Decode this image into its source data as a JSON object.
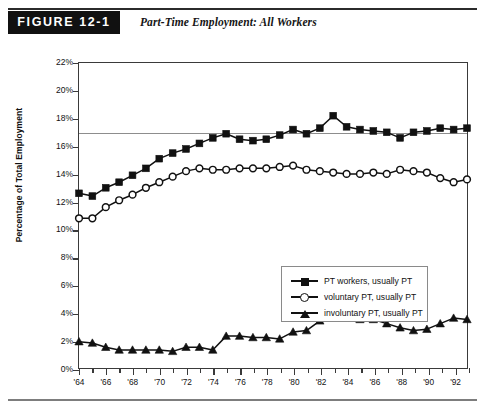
{
  "header": {
    "badge_label": "FIGURE 12-1",
    "title": "Part-Time Employment: All Workers"
  },
  "chart_data": {
    "type": "line",
    "title": "Part-Time Employment: All Workers",
    "xlabel": "",
    "ylabel": "Percentage of Total Employment",
    "ylim": [
      0,
      22
    ],
    "xlim": [
      1964,
      1993
    ],
    "ytick_labels": [
      "0%",
      "2%",
      "4%",
      "6%",
      "8%",
      "10%",
      "12%",
      "14%",
      "16%",
      "18%",
      "20%",
      "22%"
    ],
    "ytick_values": [
      0,
      2,
      4,
      6,
      8,
      10,
      12,
      14,
      16,
      18,
      20,
      22
    ],
    "xtick_labels": [
      "'64",
      "'66",
      "'68",
      "'70",
      "'72",
      "'74",
      "'76",
      "'78",
      "'80",
      "'82",
      "'84",
      "'86",
      "'88",
      "'90",
      "'92"
    ],
    "xtick_values": [
      1964,
      1966,
      1968,
      1970,
      1972,
      1974,
      1976,
      1978,
      1980,
      1982,
      1984,
      1986,
      1988,
      1990,
      1992
    ],
    "grid": false,
    "reference_line": 17.0,
    "legend_position": "center-right",
    "x": [
      1964,
      1965,
      1966,
      1967,
      1968,
      1969,
      1970,
      1971,
      1972,
      1973,
      1974,
      1975,
      1976,
      1977,
      1978,
      1979,
      1980,
      1981,
      1982,
      1983,
      1984,
      1985,
      1986,
      1987,
      1988,
      1989,
      1990,
      1991,
      1992,
      1993
    ],
    "series": [
      {
        "name": "PT workers, usually PT",
        "marker": "square-filled",
        "color": "#111111",
        "values": [
          12.6,
          12.4,
          13.0,
          13.4,
          13.9,
          14.4,
          15.1,
          15.5,
          15.8,
          16.2,
          16.6,
          16.9,
          16.5,
          16.4,
          16.5,
          16.8,
          17.2,
          16.9,
          17.3,
          18.2,
          17.4,
          17.2,
          17.1,
          17.0,
          16.6,
          17.0,
          17.1,
          17.3,
          17.2,
          17.3
        ]
      },
      {
        "name": "voluntary PT, usually PT",
        "marker": "circle-open",
        "color": "#111111",
        "values": [
          10.8,
          10.8,
          11.6,
          12.1,
          12.5,
          13.0,
          13.4,
          13.8,
          14.2,
          14.4,
          14.3,
          14.3,
          14.4,
          14.4,
          14.4,
          14.5,
          14.6,
          14.3,
          14.2,
          14.1,
          14.0,
          14.0,
          14.1,
          14.0,
          14.3,
          14.2,
          14.1,
          13.7,
          13.4,
          13.6
        ]
      },
      {
        "name": "involuntary PT, usually PT",
        "marker": "triangle-filled",
        "color": "#111111",
        "values": [
          1.9,
          1.8,
          1.5,
          1.3,
          1.3,
          1.3,
          1.3,
          1.2,
          1.5,
          1.5,
          1.3,
          2.3,
          2.3,
          2.2,
          2.2,
          2.1,
          2.6,
          2.7,
          3.4,
          4.3,
          3.7,
          3.5,
          3.5,
          3.2,
          2.9,
          2.7,
          2.8,
          3.2,
          3.6,
          3.5
        ]
      }
    ]
  },
  "legend": {
    "items": [
      {
        "label": "PT workers, usually PT",
        "marker": "square-filled"
      },
      {
        "label": "voluntary PT, usually PT",
        "marker": "circle-open"
      },
      {
        "label": "involuntary PT, usually PT",
        "marker": "triangle-filled"
      }
    ]
  }
}
